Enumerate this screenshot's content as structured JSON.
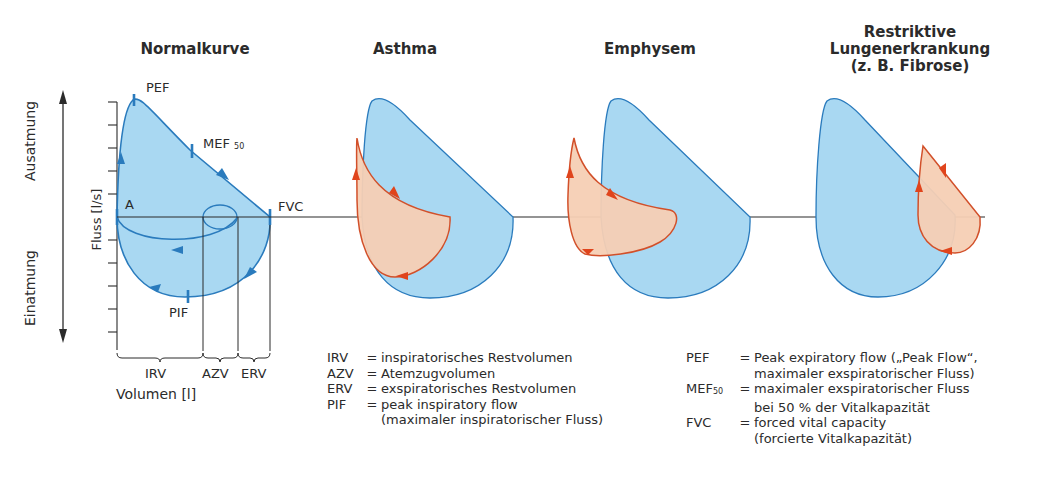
{
  "panels": [
    {
      "id": "normal",
      "title": "Normalkurve"
    },
    {
      "id": "asthma",
      "title": "Asthma"
    },
    {
      "id": "emphysem",
      "title": "Emphysem"
    },
    {
      "id": "restriktiv",
      "title_lines": [
        "Restriktive",
        "Lungenerkrankung",
        "(z. B. Fibrose)"
      ]
    }
  ],
  "axes": {
    "y_label": "Fluss [l/s]",
    "x_label": "Volumen [l]",
    "direction_up": "Ausatmung",
    "direction_down": "Einatmung"
  },
  "normal_curve_labels": {
    "pef": "PEF",
    "mef": "MEF",
    "mef_sub": "50",
    "fvc": "FVC",
    "a": "A",
    "pif": "PIF",
    "irv": "IRV",
    "azv": "AZV",
    "erv": "ERV"
  },
  "legend_left": [
    {
      "abbr": "IRV",
      "eq": "=",
      "def": [
        "inspiratorisches Restvolumen"
      ]
    },
    {
      "abbr": "AZV",
      "eq": "=",
      "def": [
        "Atemzugvolumen"
      ]
    },
    {
      "abbr": "ERV",
      "eq": "=",
      "def": [
        "exspiratorisches Restvolumen"
      ]
    },
    {
      "abbr": "PIF",
      "eq": "=",
      "def": [
        "peak inspiratory flow",
        "(maximaler inspiratorischer Fluss)"
      ]
    }
  ],
  "legend_right": [
    {
      "abbr": "PEF",
      "eq": "=",
      "def": [
        "Peak expiratory flow („Peak Flow“,",
        "maximaler exspiratorischer Fluss)"
      ]
    },
    {
      "abbr": "MEF",
      "abbr_sub": "50",
      "eq": "=",
      "def": [
        "maximaler exspiratorischer Fluss",
        "bei 50 % der Vitalkapazität"
      ]
    },
    {
      "abbr": "FVC",
      "eq": "=",
      "def": [
        "forced vital capacity",
        "(forcierte Vitalkapazität)"
      ]
    }
  ],
  "colors": {
    "normal_fill": "#a9d8f2",
    "normal_stroke": "#2a7bbd",
    "disease_fill": "#f6cfb4",
    "disease_stroke": "#d2502a",
    "arrow_red": "#e0441c",
    "axis": "#2b2b2b"
  }
}
